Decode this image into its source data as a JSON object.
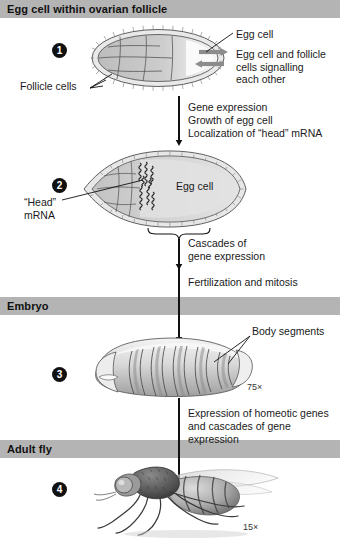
{
  "sections": [
    {
      "id": "follicle",
      "title": "Egg cell within ovarian follicle"
    },
    {
      "id": "embryo",
      "title": "Embryo"
    },
    {
      "id": "adult",
      "title": "Adult fly"
    }
  ],
  "steps": [
    {
      "number": "1"
    },
    {
      "number": "2"
    },
    {
      "number": "3"
    },
    {
      "number": "4"
    }
  ],
  "labels": {
    "follicle_cells": "Follicle cells",
    "egg_cell_1": "Egg cell",
    "signalling": "Egg cell and follicle\ncells signalling\neach other",
    "head_mrna": "“Head”\nmRNA",
    "egg_cell_2": "Egg cell",
    "body_segments": "Body segments",
    "magnification_embryo": "75×",
    "magnification_adult": "15×"
  },
  "processes": [
    {
      "id": "p1",
      "text": "Gene expression\nGrowth of egg cell\nLocalization of “head” mRNA"
    },
    {
      "id": "p2",
      "text": "Cascades of\ngene expression"
    },
    {
      "id": "p3",
      "text": "Fertilization and mitosis"
    },
    {
      "id": "p4",
      "text": "Expression of homeotic genes\nand cascades of gene expression"
    }
  ],
  "colors": {
    "banner_bg": "#b4b4b4",
    "banner_text": "#111111",
    "badge_bg": "#111111",
    "badge_text": "#ffffff",
    "cell_fill": "#c9c9c9",
    "cell_stroke": "#555555",
    "arrow": "#111111",
    "page_bg": "#ffffff"
  }
}
